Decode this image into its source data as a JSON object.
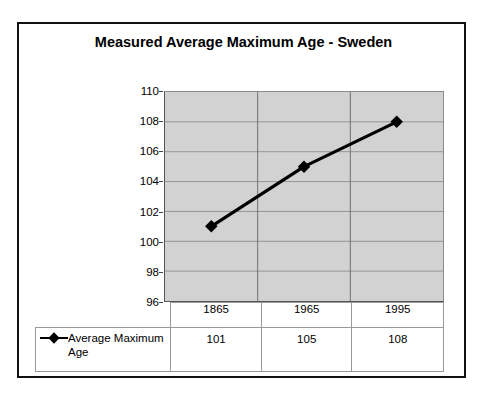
{
  "chart_data": {
    "type": "line",
    "title": "Measured Average Maximum Age - Sweden",
    "categories": [
      "1865",
      "1965",
      "1995"
    ],
    "series": [
      {
        "name": "Average Maximum Age",
        "values": [
          101,
          105,
          108
        ]
      }
    ],
    "xlabel": "",
    "ylabel": "",
    "ylim": [
      96,
      110
    ],
    "yticks": [
      "110",
      "108",
      "106",
      "104",
      "102",
      "100",
      "98",
      "96"
    ],
    "ytick_values": [
      110,
      108,
      106,
      104,
      102,
      100,
      98,
      96
    ],
    "grid": true,
    "legend_position": "bottom-table",
    "plot_background": "#d2d2d2",
    "series_color": "#000000",
    "marker": "diamond",
    "data_table": {
      "header": [
        "",
        "1865",
        "1965",
        "1995"
      ],
      "rows": [
        {
          "label": "Average Maximum Age",
          "cells": [
            "101",
            "105",
            "108"
          ]
        }
      ]
    }
  },
  "legend": {
    "marker_icon": "diamond-marker-icon",
    "series_name": "Average Maximum Age"
  }
}
